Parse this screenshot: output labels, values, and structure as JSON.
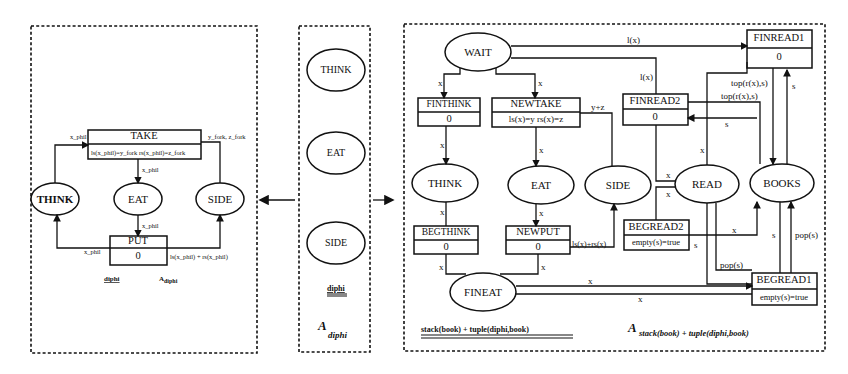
{
  "arrows": {
    "left": "left-arrow",
    "right": "right-arrow"
  },
  "left_panel": {
    "nodes": {
      "take": {
        "name": "TAKE",
        "guard": "ls(x_phil)=y_fork rs(x_phil)=z_fork"
      },
      "put": {
        "name": "PUT",
        "guard": "0"
      },
      "think": "THINK",
      "eat": "EAT",
      "side": "SIDE"
    },
    "edge_labels": {
      "think_take": "x_phil",
      "take_side": "y_fork, z_fork",
      "take_eat": "x_phil",
      "eat_put": "x_phil",
      "put_think": "x_phil",
      "put_side": "ls(x_phil) + rs(x_phil)"
    },
    "signature": "diphi",
    "title": "A",
    "title_sub": "diphi"
  },
  "middle_panel": {
    "nodes": [
      "THINK",
      "EAT",
      "SIDE"
    ],
    "signature": "diphi",
    "title": "A",
    "title_sub": "diphi"
  },
  "right_panel": {
    "places": {
      "wait": "WAIT",
      "think": "THINK",
      "eat": "EAT",
      "side": "SIDE",
      "read": "READ",
      "books": "BOOKS",
      "fineat": "FINEAT"
    },
    "transitions": {
      "finthink": {
        "name": "FINTHINK",
        "guard": "0"
      },
      "newtake": {
        "name": "NEWTAKE",
        "guard": "ls(x)=y rs(x)=z"
      },
      "finread2": {
        "name": "FINREAD2",
        "guard": "0"
      },
      "finread1": {
        "name": "FINREAD1",
        "guard": "0"
      },
      "begthink": {
        "name": "BEGTHINK",
        "guard": "0"
      },
      "newput": {
        "name": "NEWPUT",
        "guard": "0"
      },
      "begread2": {
        "name": "BEGREAD2",
        "guard": "empty(s)=true"
      },
      "begread1": {
        "name": "BEGREAD1",
        "guard": "empty(s)=true"
      }
    },
    "edge_labels": {
      "wait_finread1": "l(x)",
      "wait_finthink": "x",
      "wait_newtake": "x",
      "wait_finread2": "l(x)",
      "newtake_side": "y+z",
      "finthink_think": "x",
      "newtake_eat": "x",
      "think_begthink": "x",
      "eat_newput": "x",
      "begthink_fineat": "x",
      "newput_fineat": "x",
      "newput_side": "ls(x)+rs(x)",
      "finread1_top1": "top(r(x),s)",
      "finread1_top2": "top(r(x),s)",
      "finread1_s": "s",
      "finread2_s": "s",
      "read_finread2": "x",
      "finread2_read": "x",
      "read_begread2": "x",
      "begread2_books": "x",
      "begread2_s": "s",
      "books_s": "s",
      "books_pop": "pop(s)",
      "read_pop": "pop(s)",
      "fineat_x1": "x",
      "fineat_x2": "x"
    },
    "signature": "stack(book) + tuple(diphi,book)",
    "title": "A",
    "title_sub": "stack(book) + tuple(diphi,book)"
  }
}
